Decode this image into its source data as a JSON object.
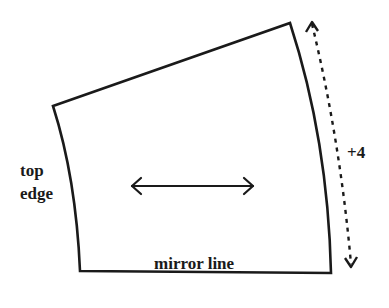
{
  "diagram": {
    "title": "",
    "labels": {
      "top_edge_line1": "top",
      "top_edge_line2": "edge",
      "mirror_line": "mirror line",
      "extension": "+4"
    },
    "colors": {
      "stroke": "#1a1a1a",
      "background": "#ffffff"
    },
    "shapes": {
      "panel": {
        "description": "pattern piece outline (quadrilateral with curved left and right sides)",
        "corners": {
          "top_left": [
            53,
            106
          ],
          "top_right": [
            290,
            23
          ],
          "bottom_right": [
            331,
            273
          ],
          "bottom_left": [
            80,
            271
          ]
        }
      },
      "grainline_arrow": {
        "description": "double-headed horizontal arrow",
        "from": [
          131,
          186
        ],
        "to": [
          254,
          186
        ]
      },
      "extension_arrow": {
        "description": "dashed double-headed arrow along right edge",
        "from": [
          311,
          20
        ],
        "to": [
          352,
          268
        ]
      }
    }
  }
}
